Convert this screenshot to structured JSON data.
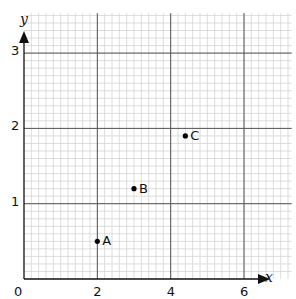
{
  "chart_data": {
    "type": "scatter",
    "title": "",
    "xlabel": "x",
    "ylabel": "y",
    "xlim": [
      0,
      7.3
    ],
    "ylim": [
      0,
      3.53
    ],
    "x_ticks": [
      0,
      2,
      4,
      6
    ],
    "y_ticks": [
      1,
      2,
      3
    ],
    "x_tick_labels": [
      "0",
      "2",
      "4",
      "6"
    ],
    "y_tick_labels": [
      "1",
      "2",
      "3"
    ],
    "grid": true,
    "minor_grid": {
      "x_step": 0.2,
      "y_step": 0.1
    },
    "major_grid": {
      "x_step": 2,
      "y_step": 1
    },
    "points": [
      {
        "label": "A",
        "x": 2,
        "y": 0.5
      },
      {
        "label": "B",
        "x": 3,
        "y": 1.2
      },
      {
        "label": "C",
        "x": 4.4,
        "y": 1.9
      }
    ],
    "colors": {
      "minor_grid": "#d4d4d4",
      "major_grid": "#555555",
      "axis": "#111111",
      "point": "#000000"
    }
  },
  "labels": {
    "origin": "0",
    "x_axis": "x",
    "y_axis": "y"
  }
}
